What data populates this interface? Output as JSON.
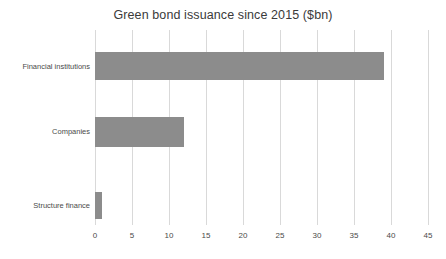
{
  "chart_data": {
    "type": "bar",
    "orientation": "horizontal",
    "title": "Green bond issuance since 2015 ($bn)",
    "xlabel": "",
    "ylabel": "",
    "categories": [
      "Financial institutions",
      "Companies",
      "Structure finance"
    ],
    "values": [
      39,
      12,
      1
    ],
    "series": [
      {
        "name": "Green bond issuance",
        "values": [
          39,
          12,
          1
        ]
      }
    ],
    "xlim": [
      0,
      45
    ],
    "xticks": [
      0,
      5,
      10,
      15,
      20,
      25,
      30,
      35,
      40,
      45
    ],
    "xtick_labels": [
      "0",
      "5",
      "10",
      "15",
      "20",
      "25",
      "30",
      "35",
      "40",
      "45"
    ],
    "grid": "vertical-only",
    "legend": "none",
    "bar_color": "#8c8c8c",
    "gridline_color": "#d9d9d9",
    "background_color": "#ffffff",
    "text_color": "#404040"
  }
}
